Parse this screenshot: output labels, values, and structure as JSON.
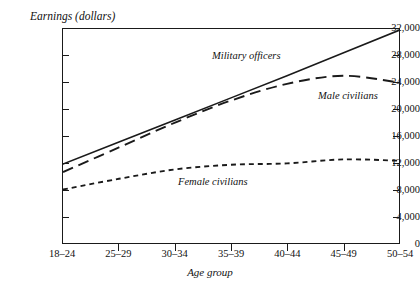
{
  "top_caption": "",
  "axis": {
    "y_title": "Earnings (dollars)",
    "x_title": "Age group",
    "y_ticks": [
      "0",
      "4,000",
      "8,000",
      "12,000",
      "16,000",
      "20,000",
      "24,000",
      "28,000",
      "32,000"
    ],
    "x_ticks": [
      "18–24",
      "25–29",
      "30–34",
      "35–39",
      "40–44",
      "45–49",
      "50–54"
    ]
  },
  "series_labels": {
    "military": "Military officers",
    "male": "Male civilians",
    "female": "Female civilians"
  },
  "colors": {
    "ink": "#1a1a1a",
    "background": "#ffffff"
  },
  "chart_data": {
    "type": "line",
    "title": "",
    "xlabel": "Age group",
    "ylabel": "Earnings (dollars)",
    "categories": [
      "18–24",
      "25–29",
      "30–34",
      "35–39",
      "40–44",
      "45–49",
      "50–54"
    ],
    "ylim": [
      0,
      32000
    ],
    "ytick_step": 4000,
    "grid": false,
    "legend": "inline-labels",
    "series": [
      {
        "name": "Military officers",
        "style": "solid",
        "values": [
          11800,
          15100,
          18400,
          21700,
          25000,
          28400,
          31800
        ]
      },
      {
        "name": "Male civilians",
        "style": "long-dash",
        "values": [
          10600,
          14300,
          18000,
          21300,
          23800,
          25000,
          24000
        ]
      },
      {
        "name": "Female civilians",
        "style": "short-dash",
        "values": [
          8000,
          9600,
          11000,
          11700,
          11900,
          12500,
          12300
        ]
      }
    ]
  }
}
